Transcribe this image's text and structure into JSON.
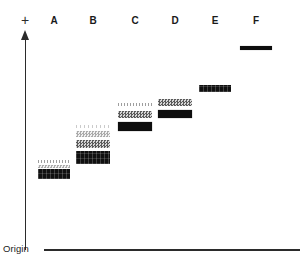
{
  "figure": {
    "origin_label": "Origin",
    "polarity_label": "+",
    "background_color": "#ffffff",
    "axis_color": "#2b2b2b"
  },
  "axes": {
    "vertical_axis_name": "migration-direction-arrow",
    "baseline_name": "origin-baseline"
  },
  "lanes": [
    {
      "label": "A",
      "x": 38,
      "width": 32,
      "bands": [
        {
          "name": "band-a1",
          "y": 160,
          "height": 3,
          "intensity": "faint",
          "color": "#7e7e7e"
        },
        {
          "name": "band-a2",
          "y": 165,
          "height": 3,
          "intensity": "light",
          "color": "#9c9c9c"
        },
        {
          "name": "band-a3",
          "y": 169,
          "height": 10,
          "intensity": "dark-speck",
          "color": "#101010"
        }
      ]
    },
    {
      "label": "B",
      "x": 76,
      "width": 34,
      "bands": [
        {
          "name": "band-b1",
          "y": 125,
          "height": 3,
          "intensity": "vfaint",
          "color": "#a8a8a8"
        },
        {
          "name": "band-b2",
          "y": 131,
          "height": 6,
          "intensity": "light",
          "color": "#9c9c9c"
        },
        {
          "name": "band-b3",
          "y": 140,
          "height": 8,
          "intensity": "medium",
          "color": "#5a5a5a"
        },
        {
          "name": "band-b4",
          "y": 151,
          "height": 13,
          "intensity": "dark-speck",
          "color": "#101010"
        }
      ]
    },
    {
      "label": "C",
      "x": 118,
      "width": 34,
      "bands": [
        {
          "name": "band-c1",
          "y": 103,
          "height": 3,
          "intensity": "faint",
          "color": "#7e7e7e"
        },
        {
          "name": "band-c2",
          "y": 111,
          "height": 7,
          "intensity": "medium",
          "color": "#5a5a5a"
        },
        {
          "name": "band-c3",
          "y": 122,
          "height": 9,
          "intensity": "dark",
          "color": "#0d0d0d"
        }
      ]
    },
    {
      "label": "D",
      "x": 158,
      "width": 34,
      "bands": [
        {
          "name": "band-d1",
          "y": 99,
          "height": 7,
          "intensity": "medium",
          "color": "#5a5a5a"
        },
        {
          "name": "band-d2",
          "y": 110,
          "height": 8,
          "intensity": "dark",
          "color": "#0d0d0d"
        }
      ]
    },
    {
      "label": "E",
      "x": 199,
      "width": 32,
      "bands": [
        {
          "name": "band-e1",
          "y": 85,
          "height": 7,
          "intensity": "dark-speck",
          "color": "#101010"
        }
      ]
    },
    {
      "label": "F",
      "x": 240,
      "width": 32,
      "bands": [
        {
          "name": "band-f1",
          "y": 46,
          "height": 4,
          "intensity": "dark",
          "color": "#0d0d0d"
        }
      ]
    }
  ],
  "chart_data": {
    "type": "table",
    "xlabel": "Sample lane",
    "ylabel": "Migration distance from origin",
    "categories": [
      "A",
      "B",
      "C",
      "D",
      "E",
      "F"
    ],
    "series": [
      {
        "name": "band count per lane",
        "values": [
          3,
          4,
          3,
          2,
          1,
          1
        ]
      }
    ],
    "annotations": [
      "Origin",
      "+"
    ],
    "legend": "none",
    "grid": false
  }
}
